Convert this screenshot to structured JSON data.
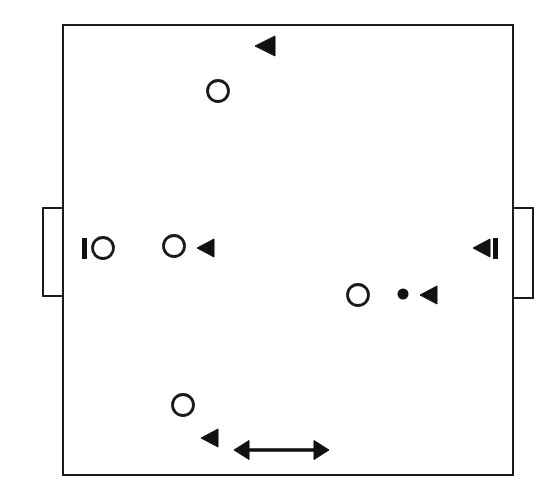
{
  "figure": {
    "kind": "tactical-pitch-diagram",
    "width": 555,
    "height": 499,
    "background_color": "#ffffff",
    "stroke_color": "#1a1a1a",
    "fill_color": "#111111",
    "title": ""
  },
  "pitch": {
    "label": "playing-area",
    "x": 63,
    "y": 25,
    "width": 450,
    "height": 450,
    "stroke_width": 2.6,
    "fill": "none"
  },
  "goals": [
    {
      "name": "left-goal",
      "side": "left",
      "x": 43,
      "y": 208,
      "width": 20,
      "height": 88,
      "stroke_width": 2.2
    },
    {
      "name": "right-goal",
      "side": "right",
      "x": 513,
      "y": 208,
      "width": 20,
      "height": 90,
      "stroke_width": 2.2
    }
  ],
  "players": [
    {
      "name": "player-top",
      "cx": 218,
      "cy": 91,
      "r": 10.5,
      "stroke_width": 2.8
    },
    {
      "name": "player-left-goalline",
      "cx": 103,
      "cy": 248,
      "r": 10.5,
      "stroke_width": 2.8
    },
    {
      "name": "player-midfield-left",
      "cx": 174,
      "cy": 246,
      "r": 10.5,
      "stroke_width": 2.8
    },
    {
      "name": "player-right-center",
      "cx": 358,
      "cy": 295,
      "r": 10.5,
      "stroke_width": 2.8
    },
    {
      "name": "player-bottom",
      "cx": 183,
      "cy": 405,
      "r": 10.5,
      "stroke_width": 2.8
    }
  ],
  "direction_markers": [
    {
      "name": "direction-marker-top",
      "tip_x": 255,
      "cy": 46,
      "length": 20,
      "half_height": 10
    },
    {
      "name": "direction-marker-midfield",
      "tip_x": 197,
      "cy": 248,
      "length": 17,
      "half_height": 9
    },
    {
      "name": "direction-marker-right-goal",
      "tip_x": 473,
      "cy": 248,
      "length": 17,
      "half_height": 9
    },
    {
      "name": "direction-marker-ball-carrier",
      "tip_x": 420,
      "cy": 295,
      "length": 17,
      "half_height": 9
    },
    {
      "name": "direction-marker-bottom",
      "tip_x": 201,
      "cy": 438,
      "length": 17,
      "half_height": 9
    }
  ],
  "bars": [
    {
      "name": "bar-left-goal",
      "x": 82,
      "y": 238,
      "width": 5,
      "height": 21
    },
    {
      "name": "bar-right-goal",
      "x": 493,
      "y": 238,
      "width": 5,
      "height": 21
    }
  ],
  "ball": {
    "name": "ball",
    "cx": 403,
    "cy": 294,
    "r": 5.5
  },
  "movement_arrow": {
    "name": "movement-double-arrow",
    "x1": 234,
    "x2": 329,
    "y": 450,
    "shaft_width": 3.4,
    "head_length": 15,
    "head_half_height": 9.5
  }
}
